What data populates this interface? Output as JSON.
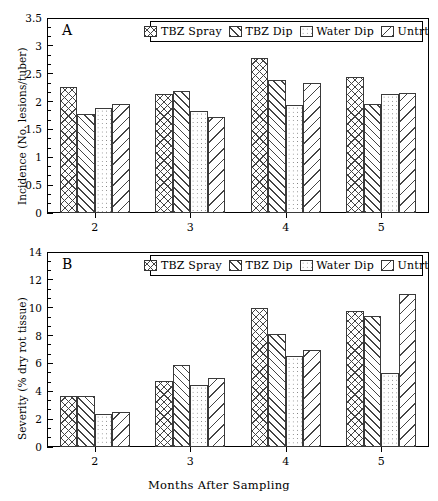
{
  "chart_data": [
    {
      "type": "bar",
      "panel": "A",
      "panel_letter": "A",
      "title": "",
      "xlabel": "",
      "ylabel": "Incidence (No. lesions/tuber)",
      "categories": [
        "2",
        "3",
        "4",
        "5"
      ],
      "ylim": [
        0,
        3.5
      ],
      "yticks": [
        0,
        0.5,
        1,
        1.5,
        2,
        2.5,
        3,
        3.5
      ],
      "ytick_labels": [
        "0",
        "0.5",
        "1",
        "1.5",
        "2",
        "2.5",
        "3",
        "3.5"
      ],
      "grid": false,
      "legend_position": "top-center",
      "series": [
        {
          "name": "TBZ Spray",
          "pattern": "crosshatch",
          "values": [
            2.27,
            2.13,
            2.79,
            2.45
          ]
        },
        {
          "name": "TBZ Dip",
          "pattern": "diagonal-up",
          "values": [
            1.78,
            2.19,
            2.38,
            1.95
          ]
        },
        {
          "name": "Water Dip",
          "pattern": "dots",
          "values": [
            1.88,
            1.83,
            1.94,
            2.13
          ]
        },
        {
          "name": "Untrt",
          "pattern": "diagonal-down",
          "values": [
            1.96,
            1.73,
            2.34,
            2.16
          ]
        }
      ]
    },
    {
      "type": "bar",
      "panel": "B",
      "panel_letter": "B",
      "title": "",
      "xlabel": "Months After Sampling",
      "ylabel": "Severity (% dry rot tissue)",
      "categories": [
        "2",
        "3",
        "4",
        "5"
      ],
      "ylim": [
        0,
        14
      ],
      "yticks": [
        0,
        2,
        4,
        6,
        8,
        10,
        12,
        14
      ],
      "ytick_labels": [
        "0",
        "2",
        "4",
        "6",
        "8",
        "10",
        "12",
        "14"
      ],
      "grid": false,
      "legend_position": "top-center",
      "series": [
        {
          "name": "TBZ Spray",
          "pattern": "crosshatch",
          "values": [
            3.65,
            4.75,
            10.0,
            9.75
          ]
        },
        {
          "name": "TBZ Dip",
          "pattern": "diagonal-up",
          "values": [
            3.65,
            5.9,
            8.1,
            9.4
          ]
        },
        {
          "name": "Water Dip",
          "pattern": "dots",
          "values": [
            2.4,
            4.45,
            6.5,
            5.3
          ]
        },
        {
          "name": "Untrt",
          "pattern": "diagonal-down",
          "values": [
            2.5,
            4.95,
            7.0,
            11.0
          ]
        }
      ]
    }
  ],
  "legend": {
    "entries": [
      {
        "label": "TBZ Spray",
        "pattern": "crosshatch"
      },
      {
        "label": "TBZ Dip",
        "pattern": "diagonal-up"
      },
      {
        "label": "Water Dip",
        "pattern": "dots"
      },
      {
        "label": "Untrt",
        "pattern": "diagonal-down"
      }
    ]
  },
  "colors": {
    "axis": "#000000",
    "bar_edge": "#3a3a3a",
    "bar_fill": "#ffffff",
    "pattern_ink": "#444444",
    "background": "#ffffff"
  }
}
